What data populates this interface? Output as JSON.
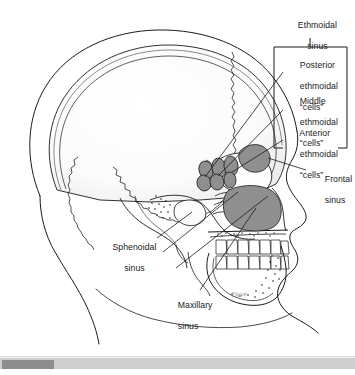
{
  "figure": {
    "illustration_type": "anatomical line drawing",
    "signature": "Dave",
    "colors": {
      "line": "#1a1a1a",
      "sinus_fill": "#8f8f8f",
      "bone_fill": "#f7f7f7",
      "background": "#ffffff",
      "label_text": "#1a1a1a"
    }
  },
  "labels": {
    "ethmoidal_sinus": {
      "line1": "Ethmoidal",
      "line2": "sinus"
    },
    "posterior_ethmoidal_cells": {
      "line1": "Posterior",
      "line2": "ethmoidal",
      "line3": "“cells”"
    },
    "middle_ethmoidal_cells": {
      "line1": "Middle",
      "line2": "ethmoidal",
      "line3": "“cells”"
    },
    "anterior_ethmoidal_cells": {
      "line1": "Anterior",
      "line2": "ethmoidal",
      "line3": "“cells”"
    },
    "frontal_sinus": {
      "line1": "Frontal",
      "line2": "sinus"
    },
    "sphenoidal_sinus": {
      "line1": "Sphenoidal",
      "line2": "sinus"
    },
    "maxillary_sinus": {
      "line1": "Maxillary",
      "line2": "sinus"
    }
  },
  "scrollbar": {
    "orientation": "horizontal",
    "thumb_position_percent": 0
  }
}
